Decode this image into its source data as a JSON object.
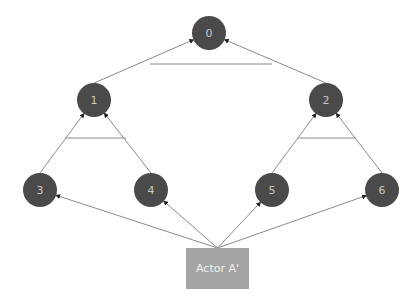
{
  "diagram": {
    "type": "tree",
    "nodes": [
      {
        "id": "0",
        "label": "0",
        "x": 209,
        "y": 33
      },
      {
        "id": "1",
        "label": "1",
        "x": 94,
        "y": 100
      },
      {
        "id": "2",
        "label": "2",
        "x": 326,
        "y": 100
      },
      {
        "id": "3",
        "label": "3",
        "x": 40,
        "y": 190
      },
      {
        "id": "4",
        "label": "4",
        "x": 151,
        "y": 190
      },
      {
        "id": "5",
        "label": "5",
        "x": 272,
        "y": 190
      },
      {
        "id": "6",
        "label": "6",
        "x": 382,
        "y": 190
      }
    ],
    "actor": {
      "label": "Actor A'",
      "x": 186,
      "y": 248,
      "width": 63,
      "height": 41
    },
    "edges": [
      {
        "from": "1",
        "to": "0"
      },
      {
        "from": "2",
        "to": "0"
      },
      {
        "from": "3",
        "to": "1"
      },
      {
        "from": "4",
        "to": "1"
      },
      {
        "from": "5",
        "to": "2"
      },
      {
        "from": "6",
        "to": "2"
      },
      {
        "from": "actor",
        "to": "3"
      },
      {
        "from": "actor",
        "to": "4"
      },
      {
        "from": "actor",
        "to": "5"
      },
      {
        "from": "actor",
        "to": "6"
      }
    ],
    "bars": [
      {
        "x1": 150,
        "x2": 272,
        "y": 64
      },
      {
        "x1": 65,
        "x2": 126,
        "y": 138
      },
      {
        "x1": 298,
        "x2": 356,
        "y": 138
      }
    ],
    "colors": {
      "node": "#4a4a4a",
      "actor": "#a4a4a4",
      "edge": "#8a8a8a"
    }
  }
}
